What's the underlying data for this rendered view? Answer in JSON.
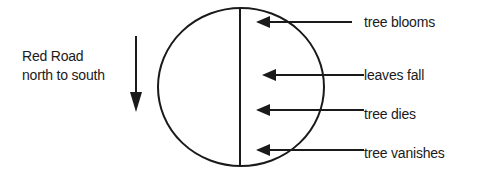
{
  "road": {
    "title": "Red Road",
    "subtitle": "north to south",
    "direction_icon": "arrow-down-icon"
  },
  "events": [
    {
      "label": "tree blooms",
      "y": 22
    },
    {
      "label": "leaves fall",
      "y": 75
    },
    {
      "label": "tree dies",
      "y": 112
    },
    {
      "label": "tree vanishes",
      "y": 151
    }
  ],
  "colors": {
    "stroke": "#1a1a1a",
    "background": "#ffffff"
  }
}
